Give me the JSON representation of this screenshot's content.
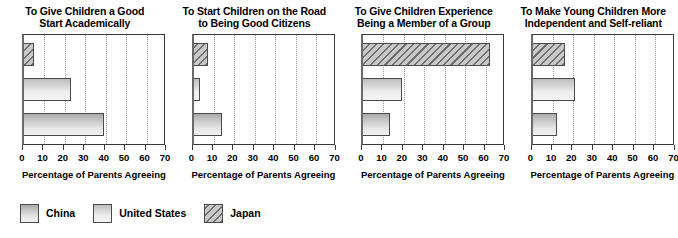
{
  "chart_data": [
    {
      "type": "bar",
      "orientation": "horizontal",
      "title": "To Give Children a Good Start Academically",
      "title_lines": [
        "To Give Children a Good",
        "Start Academically"
      ],
      "xlabel": "Percentage of Parents Agreeing",
      "ylabel": "",
      "categories": [
        "Japan",
        "United States",
        "China"
      ],
      "values": [
        5,
        23,
        39
      ],
      "xlim": [
        0,
        70
      ],
      "xticks": [
        0,
        10,
        20,
        30,
        40,
        50,
        60,
        70
      ],
      "grid": true,
      "legend_position": "bottom-left"
    },
    {
      "type": "bar",
      "orientation": "horizontal",
      "title": "To Start Children on the Road to Being Good Citizens",
      "title_lines": [
        "To Start Children on the Road",
        "to Being Good Citizens"
      ],
      "xlabel": "Percentage of Parents Agreeing",
      "ylabel": "",
      "categories": [
        "Japan",
        "United States",
        "China"
      ],
      "values": [
        7,
        3,
        14
      ],
      "xlim": [
        0,
        70
      ],
      "xticks": [
        0,
        10,
        20,
        30,
        40,
        50,
        60,
        70
      ],
      "grid": true,
      "legend_position": "bottom-left"
    },
    {
      "type": "bar",
      "orientation": "horizontal",
      "title": "To Give Children Experience Being a Member of a Group",
      "title_lines": [
        "To Give Children Experience",
        "Being a Member of a Group"
      ],
      "xlabel": "Percentage of Parents Agreeing",
      "ylabel": "",
      "categories": [
        "Japan",
        "United States",
        "China"
      ],
      "values": [
        62,
        19,
        13
      ],
      "xlim": [
        0,
        70
      ],
      "xticks": [
        0,
        10,
        20,
        30,
        40,
        50,
        60,
        70
      ],
      "grid": true,
      "legend_position": "bottom-left"
    },
    {
      "type": "bar",
      "orientation": "horizontal",
      "title": "To Make Young Children More Independent and Self-reliant",
      "title_lines": [
        "To Make Young Children More",
        "Independent and Self-reliant"
      ],
      "xlabel": "Percentage of Parents Agreeing",
      "ylabel": "",
      "categories": [
        "Japan",
        "United States",
        "China"
      ],
      "values": [
        16,
        21,
        12
      ],
      "xlim": [
        0,
        70
      ],
      "xticks": [
        0,
        10,
        20,
        30,
        40,
        50,
        60,
        70
      ],
      "grid": true,
      "legend_position": "bottom-left"
    }
  ],
  "legend": {
    "items": [
      {
        "label": "China",
        "key": "china",
        "color": "#d9d9d9",
        "pattern": "solid"
      },
      {
        "label": "United States",
        "key": "us",
        "color": "#e4e4e4",
        "pattern": "solid"
      },
      {
        "label": "Japan",
        "key": "japan",
        "color": "#c9c9c9",
        "pattern": "diagonal-hatch"
      }
    ]
  }
}
